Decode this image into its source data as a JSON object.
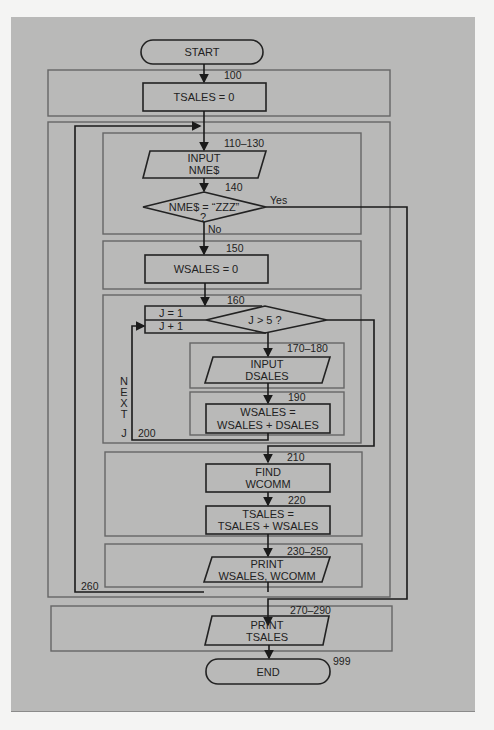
{
  "flowchart": {
    "start": "START",
    "end": "END",
    "end_line": "999",
    "steps": {
      "s100": {
        "line": "100",
        "text": "TSALES = 0"
      },
      "s110": {
        "line": "110–130",
        "text1": "INPUT",
        "text2": "NME$"
      },
      "s140": {
        "line": "140",
        "text1": "NME$ = “ZZZ”",
        "text2": "?",
        "yes": "Yes",
        "no": "No"
      },
      "s150": {
        "line": "150",
        "text": "WSALES = 0"
      },
      "s160": {
        "line": "160",
        "init": "J = 1",
        "incr": "J + 1",
        "cond": "J > 5 ?"
      },
      "s170": {
        "line": "170–180",
        "text1": "INPUT",
        "text2": "DSALES"
      },
      "s190": {
        "line": "190",
        "text1": "WSALES =",
        "text2": "WSALES + DSALES"
      },
      "s200": {
        "line": "200",
        "next_letters": [
          "N",
          "E",
          "X",
          "T"
        ],
        "next_var": "J"
      },
      "s210": {
        "line": "210",
        "text1": "FIND",
        "text2": "WCOMM"
      },
      "s220": {
        "line": "220",
        "text1": "TSALES =",
        "text2": "TSALES + WSALES"
      },
      "s230": {
        "line": "230–250",
        "text1": "PRINT",
        "text2": "WSALES, WCOMM"
      },
      "s260": {
        "line": "260"
      },
      "s270": {
        "line": "270–290",
        "text1": "PRINT",
        "text2": "TSALES"
      }
    }
  }
}
